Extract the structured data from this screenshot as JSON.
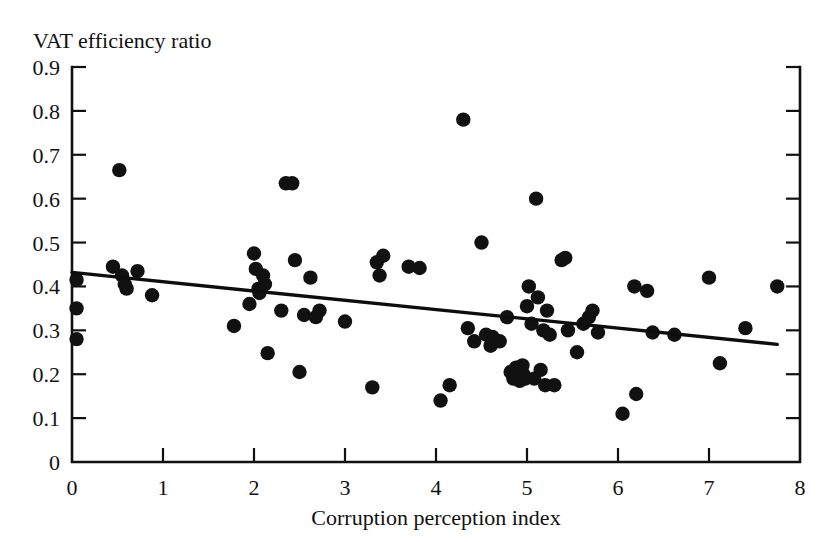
{
  "chart_data": {
    "type": "scatter",
    "title": "",
    "ylabel": "VAT efficiency ratio",
    "xlabel": "Corruption perception index",
    "xlim": [
      0,
      8
    ],
    "ylim": [
      0,
      0.9
    ],
    "xticks": [
      "0",
      "1",
      "2",
      "3",
      "4",
      "5",
      "6",
      "7",
      "8"
    ],
    "xtick_values": [
      0,
      1,
      2,
      3,
      4,
      5,
      6,
      7,
      8
    ],
    "yticks": [
      "0",
      "0.1",
      "0.2",
      "0.3",
      "0.4",
      "0.5",
      "0.6",
      "0.7",
      "0.8",
      "0.9"
    ],
    "ytick_values": [
      0,
      0.1,
      0.2,
      0.3,
      0.4,
      0.5,
      0.6,
      0.7,
      0.8,
      0.9
    ],
    "grid": false,
    "legend": false,
    "marker_color": "#111111",
    "line_color": "#0d0d0d",
    "axis_color": "#111111",
    "trend_line": {
      "name": "linear fit",
      "x": [
        0.0,
        7.75
      ],
      "y": [
        0.432,
        0.268
      ],
      "slope": -0.0212,
      "intercept": 0.432
    },
    "points": [
      [
        0.05,
        0.415
      ],
      [
        0.05,
        0.35
      ],
      [
        0.05,
        0.28
      ],
      [
        0.45,
        0.445
      ],
      [
        0.52,
        0.665
      ],
      [
        0.55,
        0.425
      ],
      [
        0.58,
        0.405
      ],
      [
        0.6,
        0.395
      ],
      [
        0.72,
        0.435
      ],
      [
        0.88,
        0.38
      ],
      [
        1.78,
        0.31
      ],
      [
        1.95,
        0.36
      ],
      [
        2.0,
        0.475
      ],
      [
        2.02,
        0.44
      ],
      [
        2.05,
        0.395
      ],
      [
        2.06,
        0.385
      ],
      [
        2.1,
        0.425
      ],
      [
        2.12,
        0.405
      ],
      [
        2.15,
        0.248
      ],
      [
        2.3,
        0.345
      ],
      [
        2.35,
        0.635
      ],
      [
        2.42,
        0.635
      ],
      [
        2.45,
        0.46
      ],
      [
        2.5,
        0.205
      ],
      [
        2.55,
        0.335
      ],
      [
        2.62,
        0.42
      ],
      [
        2.68,
        0.33
      ],
      [
        2.72,
        0.345
      ],
      [
        3.0,
        0.32
      ],
      [
        3.3,
        0.17
      ],
      [
        3.35,
        0.455
      ],
      [
        3.38,
        0.425
      ],
      [
        3.42,
        0.47
      ],
      [
        3.7,
        0.445
      ],
      [
        3.82,
        0.442
      ],
      [
        4.05,
        0.14
      ],
      [
        4.15,
        0.175
      ],
      [
        4.3,
        0.78
      ],
      [
        4.35,
        0.305
      ],
      [
        4.42,
        0.275
      ],
      [
        4.5,
        0.5
      ],
      [
        4.55,
        0.29
      ],
      [
        4.6,
        0.265
      ],
      [
        4.62,
        0.285
      ],
      [
        4.7,
        0.275
      ],
      [
        4.78,
        0.33
      ],
      [
        4.82,
        0.205
      ],
      [
        4.85,
        0.19
      ],
      [
        4.88,
        0.215
      ],
      [
        4.9,
        0.195
      ],
      [
        4.92,
        0.185
      ],
      [
        4.95,
        0.22
      ],
      [
        4.96,
        0.2
      ],
      [
        4.98,
        0.19
      ],
      [
        5.0,
        0.355
      ],
      [
        5.02,
        0.4
      ],
      [
        5.05,
        0.315
      ],
      [
        5.08,
        0.19
      ],
      [
        5.1,
        0.6
      ],
      [
        5.12,
        0.375
      ],
      [
        5.15,
        0.21
      ],
      [
        5.18,
        0.3
      ],
      [
        5.2,
        0.175
      ],
      [
        5.22,
        0.345
      ],
      [
        5.25,
        0.29
      ],
      [
        5.3,
        0.175
      ],
      [
        5.38,
        0.46
      ],
      [
        5.42,
        0.465
      ],
      [
        5.45,
        0.3
      ],
      [
        5.55,
        0.25
      ],
      [
        5.62,
        0.315
      ],
      [
        5.68,
        0.33
      ],
      [
        5.72,
        0.345
      ],
      [
        5.78,
        0.295
      ],
      [
        6.05,
        0.11
      ],
      [
        6.18,
        0.4
      ],
      [
        6.2,
        0.155
      ],
      [
        6.32,
        0.39
      ],
      [
        6.38,
        0.295
      ],
      [
        6.62,
        0.29
      ],
      [
        7.0,
        0.42
      ],
      [
        7.12,
        0.225
      ],
      [
        7.4,
        0.305
      ],
      [
        7.75,
        0.4
      ]
    ],
    "n_points": 84
  }
}
